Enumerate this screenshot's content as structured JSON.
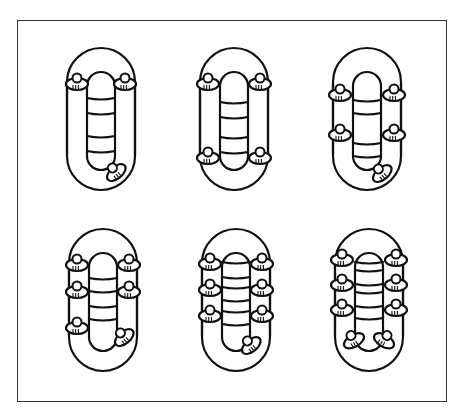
{
  "figure": {
    "description": "Six inflatable raft seating arrangements viewed from above",
    "colors": {
      "line": "#111111",
      "frame": "#333333",
      "background": "#ffffff"
    },
    "panels": [
      {
        "id": 1,
        "label": "raft-3-persons",
        "persons": 3,
        "cx": 101,
        "cy": 119,
        "rungs": [
          98,
          113,
          136,
          151
        ],
        "seats": [
          [
            -24,
            -37,
            0
          ],
          [
            24,
            -37,
            0
          ]
        ],
        "stern": [
          [
            14,
            52,
            -40
          ]
        ]
      },
      {
        "id": 2,
        "label": "raft-4-persons",
        "persons": 4,
        "cx": 234,
        "cy": 119,
        "rungs": [
          102,
          117,
          137,
          152
        ],
        "seats": [
          [
            -26,
            -37,
            0
          ],
          [
            26,
            -37,
            0
          ],
          [
            -26,
            37,
            0
          ],
          [
            26,
            37,
            0
          ]
        ],
        "stern": []
      },
      {
        "id": 3,
        "label": "raft-5-persons",
        "persons": 5,
        "cx": 367,
        "cy": 119,
        "rungs": [
          100,
          113,
          143,
          156
        ],
        "seats": [
          [
            -27,
            -26,
            0
          ],
          [
            27,
            -26,
            0
          ],
          [
            -27,
            14,
            0
          ],
          [
            27,
            14,
            0
          ]
        ],
        "stern": [
          [
            14,
            53,
            -40
          ]
        ]
      },
      {
        "id": 4,
        "label": "raft-6-persons",
        "persons": 6,
        "cx": 103,
        "cy": 300,
        "rungs": [
          278,
          291,
          306,
          319
        ],
        "seats": [
          [
            -26,
            -37,
            0
          ],
          [
            26,
            -37,
            0
          ],
          [
            -26,
            -10,
            0
          ],
          [
            26,
            -10,
            0
          ],
          [
            -26,
            26,
            0
          ]
        ],
        "stern": [
          [
            20,
            36,
            -40
          ]
        ]
      },
      {
        "id": 5,
        "label": "raft-7-persons",
        "persons": 7,
        "cx": 236,
        "cy": 300,
        "rungs": [
          262,
          277,
          287,
          300,
          311,
          324
        ],
        "seats": [
          [
            -26,
            -38,
            0
          ],
          [
            26,
            -38,
            0
          ],
          [
            -26,
            -12,
            0
          ],
          [
            26,
            -12,
            0
          ],
          [
            -26,
            14,
            0
          ],
          [
            26,
            14,
            0
          ]
        ],
        "stern": [
          [
            14,
            44,
            -40
          ]
        ]
      },
      {
        "id": 6,
        "label": "raft-8-persons",
        "persons": 8,
        "cx": 369,
        "cy": 300,
        "rungs": [
          262,
          270,
          284,
          292,
          306,
          318
        ],
        "seats": [
          [
            -27,
            -42,
            0
          ],
          [
            27,
            -42,
            0
          ],
          [
            -27,
            -17,
            0
          ],
          [
            27,
            -17,
            0
          ],
          [
            -27,
            8,
            0
          ],
          [
            27,
            8,
            0
          ]
        ],
        "stern": [
          [
            -16,
            39,
            -30
          ],
          [
            16,
            39,
            30
          ]
        ]
      }
    ]
  }
}
